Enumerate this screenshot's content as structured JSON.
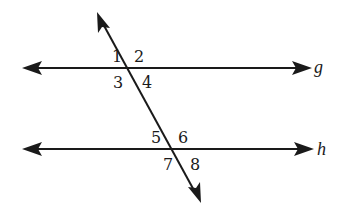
{
  "diagram": {
    "type": "parallel-lines-cut-by-transversal",
    "lines": [
      {
        "id": "g",
        "label": "g",
        "y": 68
      },
      {
        "id": "h",
        "label": "h",
        "y": 149
      }
    ],
    "transversal": {
      "x1": 97,
      "y1": 12,
      "x2": 201,
      "y2": 203
    },
    "angles": [
      {
        "label": "1",
        "x": 112,
        "y": 62
      },
      {
        "label": "2",
        "x": 134,
        "y": 62
      },
      {
        "label": "3",
        "x": 113,
        "y": 88
      },
      {
        "label": "4",
        "x": 142,
        "y": 88
      },
      {
        "label": "5",
        "x": 151,
        "y": 143
      },
      {
        "label": "6",
        "x": 178,
        "y": 143
      },
      {
        "label": "7",
        "x": 163,
        "y": 170
      },
      {
        "label": "8",
        "x": 190,
        "y": 170
      }
    ],
    "colors": {
      "stroke": "#1a1a1a",
      "background": "#ffffff"
    }
  }
}
